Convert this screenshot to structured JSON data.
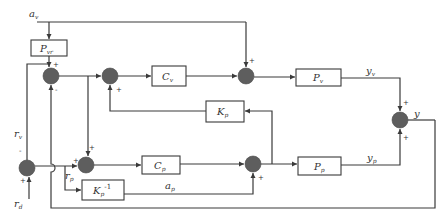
{
  "diagram": {
    "signals": {
      "a_v": "a",
      "a_v_sub": "v",
      "r_v": "r",
      "r_v_sub": "v",
      "r_d": "r",
      "r_d_sub": "d",
      "r_p": "r",
      "r_p_sub": "p",
      "a_p": "a",
      "a_p_sub": "p",
      "y_v": "y",
      "y_v_sub": "v",
      "y_p": "y",
      "y_p_sub": "p",
      "y": "y"
    },
    "blocks": {
      "p_vr": {
        "main": "P",
        "sub": "vr"
      },
      "c_v": {
        "main": "C",
        "sub": "v"
      },
      "p_v": {
        "main": "P",
        "sub": "v"
      },
      "k_p": {
        "main": "K",
        "sub": "p"
      },
      "c_p": {
        "main": "C",
        "sub": "p"
      },
      "p_p": {
        "main": "P",
        "sub": "p"
      },
      "k_p_inv": {
        "main": "K",
        "sub": "p",
        "sup": "-1"
      }
    },
    "signs": {
      "sum1_top": "+",
      "sum1_bottom": "-",
      "sum2_bottom": "+",
      "sum3_top": "+",
      "sum4_top": "+",
      "sum4_bottom": "+",
      "sumleft_top": "-",
      "sumleft_bottom": "+",
      "sum5_left": "+",
      "sum5_top": "+",
      "sum6_bottom": "+"
    },
    "colors": {
      "line": "#3a3a3a",
      "summing_junction": "#5e5e5e",
      "background": "#ffffff"
    }
  }
}
